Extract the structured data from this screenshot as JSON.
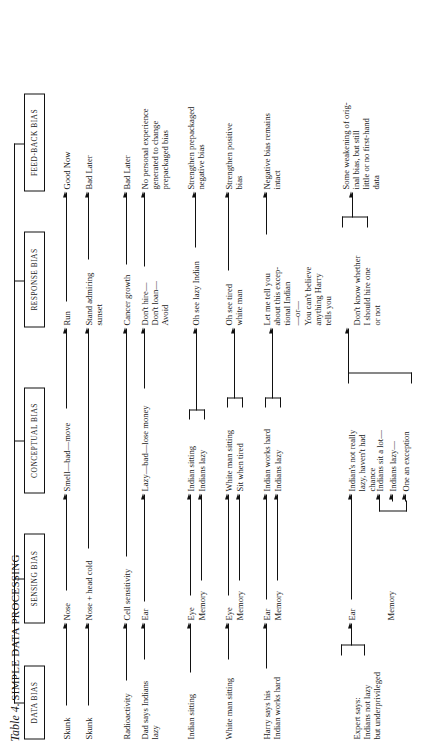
{
  "title": {
    "label_italic": "Table 4.",
    "label_caps": "SIMPLE DATA PROCESSING"
  },
  "columns": [
    {
      "id": "data-bias",
      "label": "DATA BIAS"
    },
    {
      "id": "sensing-bias",
      "label": "SENSING BIAS"
    },
    {
      "id": "conceptual-bias",
      "label": "CONCEPTUAL BIAS"
    },
    {
      "id": "response-bias",
      "label": "RESPONSE BIAS"
    },
    {
      "id": "feedback-bias",
      "label": "FEED-BACK BIAS"
    }
  ],
  "rows": [
    {
      "id": "row-skunk-1",
      "data_bias": "Skunk",
      "sensing_bias": "Nose",
      "conceptual_bias": "Smell—bad—move",
      "response_bias": "Run",
      "feedback_bias": "Good Now"
    },
    {
      "id": "row-skunk-2",
      "data_bias": "Skunk",
      "sensing_bias": "Nose + head cold",
      "conceptual_bias": "",
      "response_bias": "Stand admiring\nsunset",
      "feedback_bias": "Bad Later"
    },
    {
      "id": "row-radioactivity",
      "data_bias": "Radioactivity",
      "sensing_bias": "Cell sensitivity",
      "conceptual_bias": "",
      "response_bias": "Cancer growth",
      "feedback_bias": "Bad Later"
    },
    {
      "id": "row-dad-says",
      "data_bias": "Dad says Indians\nlazy",
      "sensing_bias": "Ear",
      "conceptual_bias": "Lazy—bad—lose money",
      "response_bias": "Don't hire—\nDon't loan—\nAvoid",
      "feedback_bias": "No personal experience\ngenerated to change\nprepackaged bias"
    },
    {
      "id": "row-indian-sitting",
      "data_bias": "Indian sitting",
      "sensing_bias": [
        "Eye",
        "Memory"
      ],
      "conceptual_bias": [
        "Indian sitting",
        "Indians lazy"
      ],
      "response_bias": "Oh see lazy Indian",
      "feedback_bias": "Strengthen prepackaged\nnegative bias"
    },
    {
      "id": "row-white-man-sitting",
      "data_bias": "White man sitting",
      "sensing_bias": [
        "Eye",
        "Memory"
      ],
      "conceptual_bias": [
        "White man sitting",
        "Sit when tired"
      ],
      "response_bias": "Oh see tired\nwhite man",
      "feedback_bias": "Strengthen positive\nbias"
    },
    {
      "id": "row-harry-says",
      "data_bias": "Harry says his\nIndian works hard",
      "sensing_bias": [
        "Ear",
        "Memory"
      ],
      "conceptual_bias": [
        "Indian works hard",
        "Indians lazy"
      ],
      "response_bias": "Let me tell you\nabout this excep-\ntional Indian\n—or—\nYou can't believe\nanything Harry\ntells you",
      "feedback_bias": "Negative bias remains\nintact"
    },
    {
      "id": "row-expert-says",
      "data_bias": "Expert says:\nIndians not lazy\nbut underprivileged",
      "sensing_bias": [
        "Ear",
        "Memory"
      ],
      "conceptual_bias": [
        "Indian's not really\nlazy, haven't had\nchance",
        "Indians sit a lot—",
        "Indians lazy—",
        "One an exception"
      ],
      "response_bias": "Don't know whether\nI should hire one\nor not",
      "feedback_bias": "Some weakening of orig-\ninal bias, but still\nlittle or no first-hand\ndata"
    }
  ]
}
